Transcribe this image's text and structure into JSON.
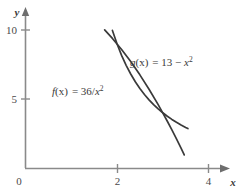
{
  "chart_data": {
    "type": "line",
    "title": "",
    "xlabel": "x",
    "ylabel": "y",
    "xlim": [
      0,
      4.45
    ],
    "ylim": [
      0,
      10.9
    ],
    "grid": false,
    "legend_position": "inline-annotations",
    "origin_label": "0",
    "xticks": [
      2,
      4
    ],
    "xtick_labels": [
      "2",
      "4"
    ],
    "yticks": [
      5,
      10
    ],
    "ytick_labels": [
      "5",
      "10"
    ],
    "series": [
      {
        "name": "f",
        "expression": "36/x^2",
        "label_prefix": "f",
        "label_arg": "(x)",
        "label_eq": "= 36/",
        "label_var": "x",
        "label_exp": "2",
        "x": [
          1.9,
          2.0,
          2.1,
          2.2,
          2.3,
          2.4,
          2.5,
          2.6,
          2.7,
          2.8,
          2.9,
          3.0,
          3.1,
          3.2,
          3.3,
          3.4,
          3.5,
          3.55
        ],
        "values": [
          9.97,
          9.0,
          8.16,
          7.44,
          6.81,
          6.25,
          5.76,
          5.33,
          4.94,
          4.59,
          4.28,
          4.0,
          3.75,
          3.52,
          3.31,
          3.11,
          2.94,
          2.86
        ]
      },
      {
        "name": "g",
        "expression": "13 - x^2",
        "label_prefix": "g",
        "label_arg": "(x)",
        "label_eq": "= 13 − ",
        "label_var": "x",
        "label_exp": "2",
        "x": [
          1.73,
          1.9,
          2.1,
          2.3,
          2.5,
          2.7,
          2.9,
          3.0,
          3.1,
          3.2,
          3.3,
          3.4,
          3.47
        ],
        "values": [
          10.01,
          9.39,
          8.59,
          7.71,
          6.75,
          5.71,
          4.59,
          4.0,
          3.39,
          2.76,
          2.11,
          1.44,
          0.95
        ]
      }
    ],
    "intersections": [
      {
        "x": 2.0,
        "y": 9.0
      },
      {
        "x": 3.0,
        "y": 4.0
      }
    ],
    "annotations": [
      {
        "name": "g-label",
        "x_px": 148,
        "y_px": 62
      },
      {
        "name": "f-label",
        "x_px": 70,
        "y_px": 91
      }
    ]
  },
  "colors": {
    "axis": "#8a8a8a",
    "curve": "#3a3a3a",
    "text": "#3a3a3a",
    "tick_text": "#4a4a4a",
    "background": "#ffffff"
  }
}
